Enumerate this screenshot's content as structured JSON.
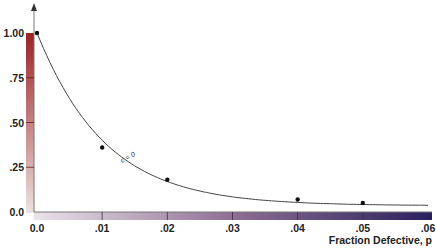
{
  "chart_data": {
    "type": "line",
    "title": "",
    "ylabel": "Probability of Acceptance, Pa",
    "xlabel": "Fraction Defective, p",
    "xlim": [
      0,
      0.06
    ],
    "ylim": [
      0,
      1.0
    ],
    "x_ticks": [
      "0.0",
      ".01",
      ".02",
      ".03",
      ".04",
      ".05",
      ".06"
    ],
    "y_ticks": [
      "0.0",
      ".25",
      ".50",
      ".75",
      "1.00"
    ],
    "grid": false,
    "legend": null,
    "series": [
      {
        "name": "c = 0",
        "x": [
          0.0,
          0.01,
          0.02,
          0.04,
          0.05
        ],
        "y": [
          1.0,
          0.36,
          0.18,
          0.07,
          0.05
        ],
        "markers": true
      }
    ],
    "annotations": [
      {
        "text": "c = 0",
        "x": 0.015,
        "y": 0.26
      }
    ],
    "colors": {
      "y_axis_bar_top": "#9b2226",
      "y_axis_bar_bottom": "#e8dcd8",
      "x_axis_bar_left": "#e6dde6",
      "x_axis_bar_right": "#2a1f5e",
      "curve": "#333333"
    }
  }
}
